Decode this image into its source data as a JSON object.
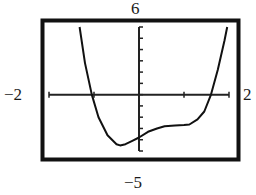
{
  "window": {
    "ymax_label": "6",
    "ymin_label": "−5",
    "xmin_label": "−2",
    "xmax_label": "2"
  },
  "colors": {
    "frame": "#111111",
    "axis": "#222222",
    "curve": "#111111",
    "background": "#ffffff"
  },
  "chart_data": {
    "type": "line",
    "title": "",
    "xlabel": "",
    "ylabel": "",
    "xlim": [
      -2,
      2
    ],
    "ylim": [
      -5,
      6
    ],
    "x_ticks": [
      -2,
      -1,
      0,
      1,
      2
    ],
    "y_ticks": [
      -5,
      -4,
      -3,
      -2,
      -1,
      0,
      1,
      2,
      3,
      4,
      5,
      6
    ],
    "grid": false,
    "legend": null,
    "tick_labels_shown": {
      "xmin": "−2",
      "xmax": "2",
      "ymin": "−5",
      "ymax": "6"
    },
    "series": [
      {
        "name": "f(x)",
        "x": [
          -1.32,
          -1.2,
          -1.05,
          -0.9,
          -0.7,
          -0.5,
          -0.42,
          -0.3,
          -0.15,
          0.0,
          0.2,
          0.4,
          0.57,
          0.8,
          1.0,
          1.12,
          1.3,
          1.45,
          1.6,
          1.75,
          1.9,
          1.96
        ],
        "y": [
          6.0,
          2.8,
          0.0,
          -2.0,
          -3.6,
          -4.4,
          -4.5,
          -4.4,
          -4.1,
          -3.8,
          -3.3,
          -3.0,
          -2.8,
          -2.75,
          -2.7,
          -2.65,
          -2.2,
          -1.5,
          0.0,
          2.2,
          4.8,
          6.0
        ]
      }
    ],
    "annotations": [
      {
        "text": "6",
        "position": "above window (Ymax)"
      },
      {
        "text": "−5",
        "position": "below window (Ymin)"
      },
      {
        "text": "−2",
        "position": "left of window (Xmin)"
      },
      {
        "text": "2",
        "position": "right of window (Xmax)"
      }
    ]
  }
}
